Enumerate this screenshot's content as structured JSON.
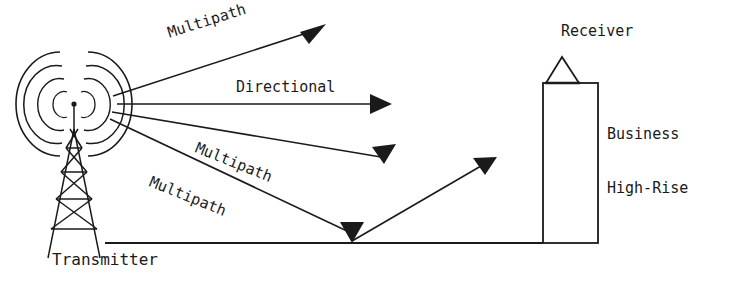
{
  "diagram": {
    "stroke_color": "#1a1a1a",
    "background_color": "#ffffff",
    "labels": {
      "transmitter": "Transmitter",
      "receiver": "Receiver",
      "building_line1": "Business",
      "building_line2": "High-Rise",
      "directional": "Directional",
      "multipath_top": "Multipath",
      "multipath_middle": "Multipath",
      "multipath_bottom": "Multipath"
    },
    "nodes": {
      "transmitter": {
        "name": "transmitter-tower",
        "antenna_tip_x": 74,
        "antenna_tip_y": 104,
        "radiation_arc_count": 4
      },
      "receiver": {
        "name": "business-high-rise",
        "building_left": 543,
        "building_right": 598,
        "building_top": 83,
        "building_bottom": 243,
        "antenna_shape": "triangle"
      },
      "ground": {
        "name": "ground-line",
        "x_start": 105,
        "x_end": 543,
        "y": 243
      }
    },
    "rays": [
      {
        "name": "multipath-upper",
        "label": "Multipath",
        "from_x": 113,
        "from_y": 96,
        "to_x": 322,
        "to_y": 28,
        "arrow": "end"
      },
      {
        "name": "directional",
        "label": "Directional",
        "from_x": 117,
        "from_y": 104,
        "to_x": 392,
        "to_y": 104,
        "arrow": "end"
      },
      {
        "name": "multipath-middle",
        "label": "Multipath",
        "from_x": 112,
        "from_y": 112,
        "to_x": 394,
        "to_y": 150,
        "arrow": "end"
      },
      {
        "name": "multipath-ground",
        "label": "Multipath",
        "from_x": 110,
        "from_y": 119,
        "to_x": 352,
        "to_y": 240,
        "arrow": "end-down"
      },
      {
        "name": "ground-reflection",
        "label": "",
        "from_x": 352,
        "from_y": 241,
        "to_x": 497,
        "to_y": 157,
        "arrow": "end"
      }
    ]
  }
}
